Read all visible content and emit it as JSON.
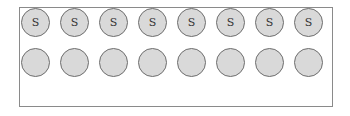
{
  "rows": [
    {
      "circles": [
        {
          "label": "S"
        },
        {
          "label": "S"
        },
        {
          "label": "S"
        },
        {
          "label": "S"
        },
        {
          "label": "S"
        },
        {
          "label": "S"
        },
        {
          "label": "S"
        },
        {
          "label": "S"
        }
      ]
    },
    {
      "circles": [
        {
          "label": ""
        },
        {
          "label": ""
        },
        {
          "label": ""
        },
        {
          "label": ""
        },
        {
          "label": ""
        },
        {
          "label": ""
        },
        {
          "label": ""
        },
        {
          "label": ""
        }
      ]
    }
  ],
  "colors": {
    "circle_fill": "#d9d9d9",
    "circle_border": "#6e6e6e",
    "frame_border": "#8a8a8a"
  }
}
